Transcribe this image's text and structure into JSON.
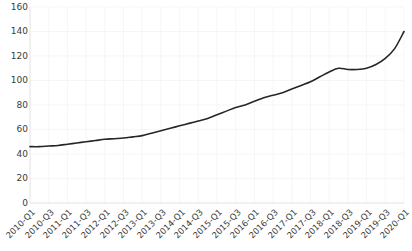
{
  "chart_data": {
    "type": "line",
    "title": "",
    "subtitle": "",
    "xlabel": "",
    "ylabel": "",
    "ylim": [
      0,
      160
    ],
    "yticks": [
      0,
      20,
      40,
      60,
      80,
      100,
      120,
      140,
      160
    ],
    "grid": true,
    "grid_axis": "both",
    "legend": false,
    "legend_position": "none",
    "line_color": "#262626",
    "line_width": 1.6,
    "background_color": "#ffffff",
    "text_color": "#3b3b3b",
    "grid_color": "#f2f2f2",
    "xtick_rotation": -45,
    "xtick_labels": [
      "2010-Q1",
      "2010-Q3",
      "2011-Q1",
      "2011-Q3",
      "2012-Q1",
      "2012-Q3",
      "2013-Q1",
      "2013-Q3",
      "2014-Q1",
      "2014-Q3",
      "2015-Q1",
      "2015-Q3",
      "2016-Q1",
      "2016-Q3",
      "2017-Q1",
      "2017-Q3",
      "2018-Q1",
      "2018-Q3",
      "2019-Q1",
      "2019-Q3",
      "2020-Q1"
    ],
    "categories": [
      "2010-Q1",
      "2010-Q2",
      "2010-Q3",
      "2010-Q4",
      "2011-Q1",
      "2011-Q2",
      "2011-Q3",
      "2011-Q4",
      "2012-Q1",
      "2012-Q2",
      "2012-Q3",
      "2012-Q4",
      "2013-Q1",
      "2013-Q2",
      "2013-Q3",
      "2013-Q4",
      "2014-Q1",
      "2014-Q2",
      "2014-Q3",
      "2014-Q4",
      "2015-Q1",
      "2015-Q2",
      "2015-Q3",
      "2015-Q4",
      "2016-Q1",
      "2016-Q2",
      "2016-Q3",
      "2016-Q4",
      "2017-Q1",
      "2017-Q2",
      "2017-Q3",
      "2017-Q4",
      "2018-Q1",
      "2018-Q2",
      "2018-Q3",
      "2018-Q4",
      "2019-Q1",
      "2019-Q2",
      "2019-Q3",
      "2019-Q4",
      "2020-Q1"
    ],
    "values": [
      46,
      46,
      46.5,
      47,
      48,
      49,
      50,
      51,
      52,
      52.5,
      53,
      54,
      55,
      57,
      59,
      61,
      63,
      65,
      67,
      69,
      72,
      75,
      78,
      80,
      83,
      86,
      88,
      90,
      93,
      96,
      99,
      103,
      107,
      110,
      109,
      109,
      110,
      113,
      118,
      126,
      140
    ]
  }
}
